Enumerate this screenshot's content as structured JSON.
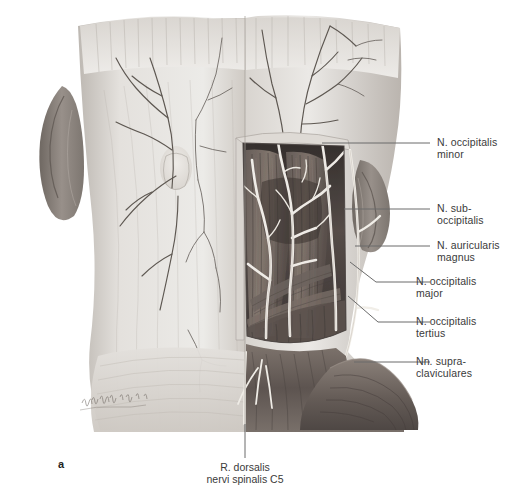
{
  "figure": {
    "panel_label": "a",
    "artist_signature": "signature",
    "bottom_caption": "R. dorsalis\nnervi spinalis C5"
  },
  "labels": [
    {
      "id": "n-occipitalis-minor",
      "text": "N. occipitalis\nminor"
    },
    {
      "id": "n-suboccipitalis",
      "text": "N. sub-\noccipitalis"
    },
    {
      "id": "n-auricularis-magnus",
      "text": "N. auricularis\nmagnus"
    },
    {
      "id": "n-occipitalis-major",
      "text": "N. occipitalis\nmajor"
    },
    {
      "id": "n-occipitalis-tertius",
      "text": "N. occipitalis\ntertius"
    },
    {
      "id": "nn-supraclaviculares",
      "text": "Nn. supra-\nclaviculares"
    }
  ],
  "colors": {
    "background": "#ffffff",
    "leader_line": "#6b6b6b",
    "text": "#3a3a3a",
    "skin_light": "#e9e7e4",
    "skin_mid": "#cfcac5",
    "skin_shadow": "#a9a39d",
    "ear": "#8f8780",
    "muscle_dark": "#4a4340",
    "muscle_mid": "#6d635e",
    "muscle_light": "#8d8179",
    "nerve": "#f2efe9",
    "outline": "#5a5450"
  }
}
